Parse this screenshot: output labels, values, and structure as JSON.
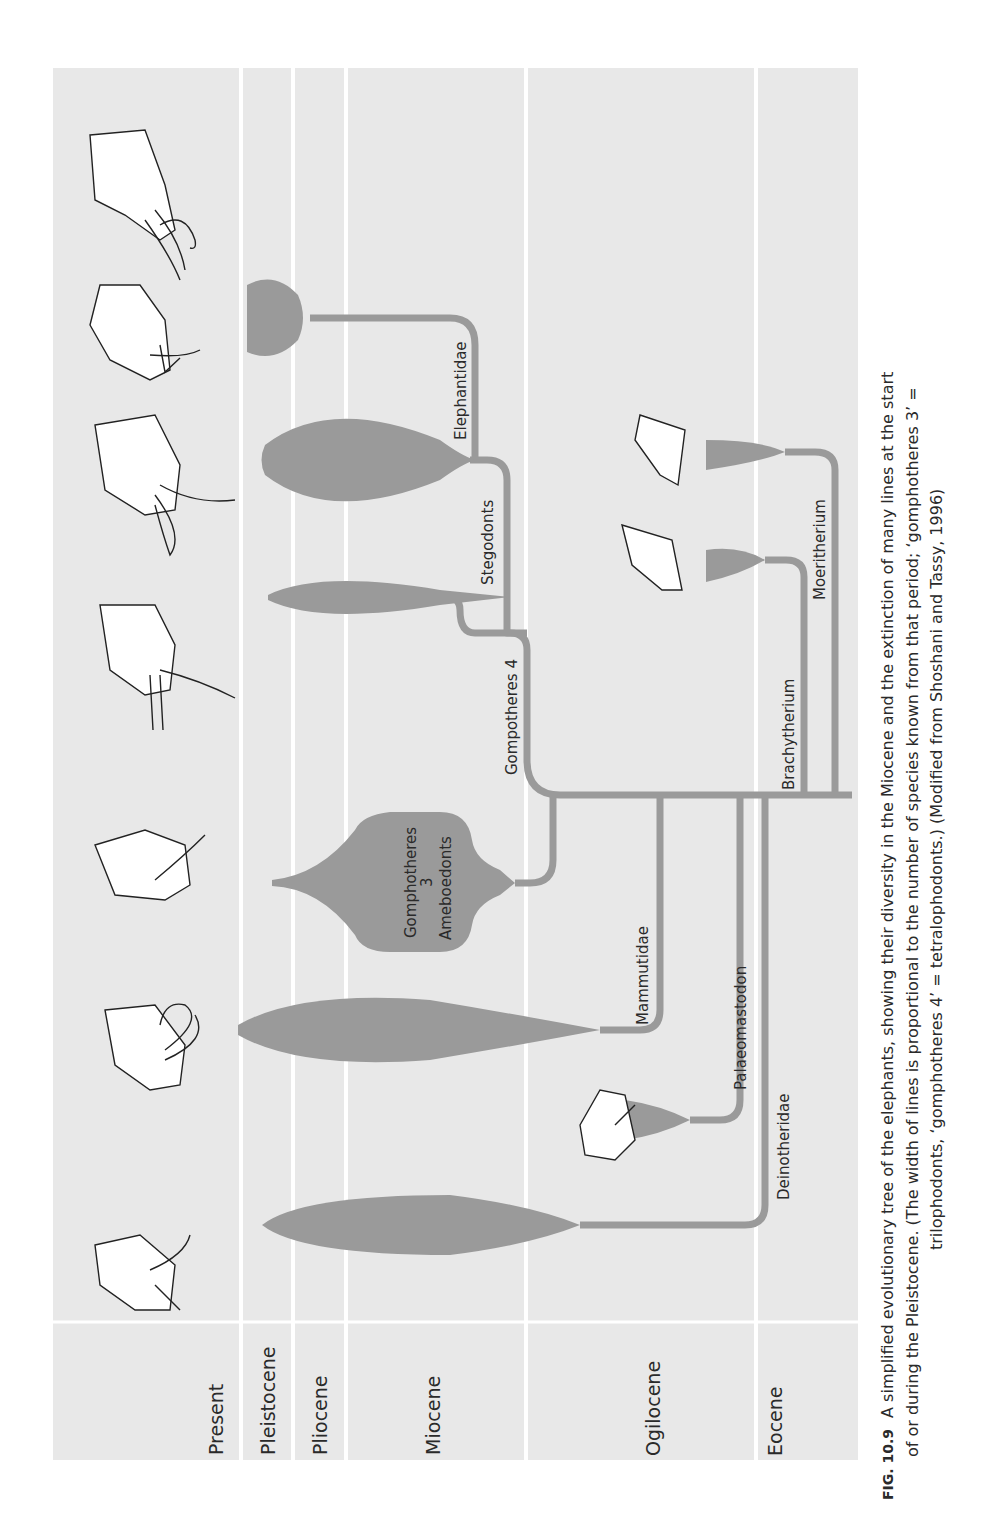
{
  "figure": {
    "number": "FIG. 10.9",
    "caption_line1": "A simplified evolutionary tree of the elephants, showing their diversity in the Miocene and the extinction of many lines at the start",
    "caption_line2": "of or during the Pleistocene. (The width of lines is proportional to the number of species known from that period; ‘gomphotheres 3’ =",
    "caption_line3": "trilophodonts, ‘gomphotheres 4’ = tetralophodonts.) (Modified from Shoshani and Tassy, 1996)",
    "colors": {
      "band": "#e8e8e8",
      "branch": "#9a9a9a",
      "separator": "#ffffff",
      "text": "#2a2a2a"
    }
  },
  "periods": [
    {
      "label": "Present"
    },
    {
      "label": "Pleistocene"
    },
    {
      "label": "Pliocene"
    },
    {
      "label": "Miocene"
    },
    {
      "label": "Ogilocene"
    },
    {
      "label": "Eocene"
    }
  ],
  "lineages": [
    {
      "label": "Elephantidae"
    },
    {
      "label": "Stegodonts"
    },
    {
      "label": "Gompotheres 4"
    },
    {
      "label": "Gomphotheres",
      "label_line2": "3",
      "label_line3": "Ameboedonts"
    },
    {
      "label": "Mammutidae"
    },
    {
      "label": "Palaeomastodon"
    },
    {
      "label": "Deinotheridae"
    },
    {
      "label": "Brachytherium"
    },
    {
      "label": "Moeritherium"
    }
  ],
  "illustrations": [
    {
      "name": "mammoth-head"
    },
    {
      "name": "asian-elephant-head"
    },
    {
      "name": "african-elephant-head"
    },
    {
      "name": "stegodon-head"
    },
    {
      "name": "gomphothere-head"
    },
    {
      "name": "mammut-head"
    },
    {
      "name": "palaeomastodon-head"
    },
    {
      "name": "deinotherium-head"
    },
    {
      "name": "barytherium-head"
    },
    {
      "name": "moeritherium-head"
    }
  ]
}
